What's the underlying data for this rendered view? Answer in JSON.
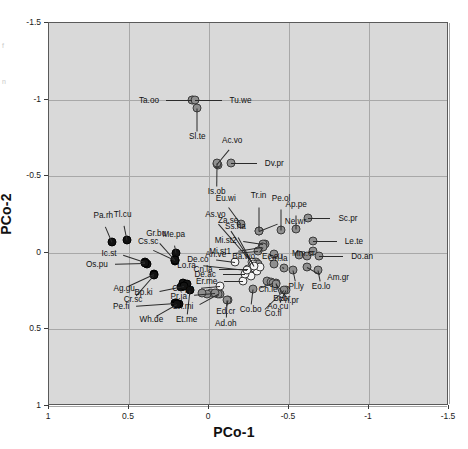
{
  "chart_data": {
    "type": "scatter",
    "title": "",
    "xlabel": "PCo-1",
    "ylabel": "PCo-2",
    "xlim": [
      1,
      -1.5
    ],
    "ylim": [
      -1.5,
      1
    ],
    "xticks": [
      "1",
      "0.5",
      "0",
      "-0.5",
      "-1",
      "-1.5"
    ],
    "xtickvalues": [
      1,
      0.5,
      0,
      -0.5,
      -1,
      -1.5
    ],
    "yticks": [
      "-1.5",
      "-1",
      "-0.5",
      "0",
      "0.5",
      "1"
    ],
    "ytickvalues": [
      -1.5,
      -1,
      -0.5,
      0,
      0.5,
      1
    ],
    "grid": true,
    "legend": "none",
    "plot_background": "#d9d9d9",
    "marker_groups": [
      {
        "name": "black-filled",
        "color": "#121212"
      },
      {
        "name": "gray-filled",
        "color": "#8f8f8f"
      },
      {
        "name": "white-open",
        "color": "#f4f4f4"
      }
    ],
    "points": [
      {
        "label": "Ta.oo",
        "x": 0.105,
        "y": -1.0,
        "group": "gray",
        "lx": 0.3,
        "ly": -1.0,
        "anchor": "r"
      },
      {
        "label": "Tu.we",
        "x": 0.09,
        "y": -1.0,
        "group": "gray",
        "lx": -0.11,
        "ly": -1.0,
        "anchor": "l"
      },
      {
        "label": "Sl.te",
        "x": 0.073,
        "y": -0.945,
        "group": "gray",
        "lx": 0.073,
        "ly": -0.76,
        "anchor": "c"
      },
      {
        "label": "Ac.vo",
        "x": -0.05,
        "y": -0.58,
        "group": "gray",
        "lx": -0.145,
        "ly": -0.7,
        "anchor": "c"
      },
      {
        "label": "Is.ob",
        "x": -0.05,
        "y": -0.585,
        "group": "gray",
        "lx": -0.048,
        "ly": -0.405,
        "anchor": "c"
      },
      {
        "label": "Dv.pr",
        "x": -0.14,
        "y": -0.585,
        "group": "gray",
        "lx": -0.33,
        "ly": -0.585,
        "anchor": "l"
      },
      {
        "label": "Eu.wi",
        "x": -0.2,
        "y": -0.185,
        "group": "gray",
        "lx": -0.105,
        "ly": -0.32,
        "anchor": "c"
      },
      {
        "label": "Tr.in",
        "x": -0.31,
        "y": -0.145,
        "group": "gray",
        "lx": -0.31,
        "ly": -0.335,
        "anchor": "c"
      },
      {
        "label": "Ne.wr",
        "x": -0.31,
        "y": -0.145,
        "group": "gray",
        "lx": -0.455,
        "ly": -0.205,
        "anchor": "l"
      },
      {
        "label": "Pe.ol",
        "x": -0.45,
        "y": -0.15,
        "group": "gray",
        "lx": -0.45,
        "ly": -0.32,
        "anchor": "c"
      },
      {
        "label": "Ap.pe",
        "x": -0.545,
        "y": -0.155,
        "group": "gray",
        "lx": -0.545,
        "ly": -0.28,
        "anchor": "c"
      },
      {
        "label": "Sc.pr",
        "x": -0.62,
        "y": -0.23,
        "group": "gray",
        "lx": -0.79,
        "ly": -0.23,
        "anchor": "l"
      },
      {
        "label": "Le.te",
        "x": -0.65,
        "y": -0.08,
        "group": "gray",
        "lx": -0.83,
        "ly": -0.08,
        "anchor": "l"
      },
      {
        "label": "Mi.st2",
        "x": -0.34,
        "y": -0.06,
        "group": "gray",
        "lx": -0.185,
        "ly": -0.085,
        "anchor": "r"
      },
      {
        "label": "Mi.st1",
        "x": -0.33,
        "y": -0.04,
        "group": "gray",
        "lx": -0.15,
        "ly": -0.01,
        "anchor": "r"
      },
      {
        "label": "Mm.cr",
        "x": -0.65,
        "y": -0.01,
        "group": "gray",
        "lx": -0.59,
        "ly": 0.0,
        "anchor": "c"
      },
      {
        "label": "Ec.cu",
        "x": -0.405,
        "y": 0.01,
        "group": "gray",
        "lx": -0.395,
        "ly": 0.018,
        "anchor": "c"
      },
      {
        "label": "Do.an",
        "x": -0.69,
        "y": 0.022,
        "group": "gray",
        "lx": -0.87,
        "ly": 0.022,
        "anchor": "l"
      },
      {
        "label": "Ba.wo",
        "x": -0.34,
        "y": -0.04,
        "group": "gray",
        "lx": -0.3,
        "ly": 0.022,
        "anchor": "r"
      },
      {
        "label": "An.ve",
        "x": -0.305,
        "y": -0.01,
        "group": "gray",
        "lx": -0.12,
        "ly": 0.005,
        "anchor": "r"
      },
      {
        "label": "On.la",
        "x": -0.47,
        "y": 0.1,
        "group": "gray",
        "lx": -0.43,
        "ly": 0.075,
        "anchor": "c"
      },
      {
        "label": "Am.gr",
        "x": -0.61,
        "y": 0.095,
        "group": "gray",
        "lx": -0.72,
        "ly": 0.16,
        "anchor": "l"
      },
      {
        "label": "Eo.lo",
        "x": -0.68,
        "y": 0.11,
        "group": "gray",
        "lx": -0.7,
        "ly": 0.215,
        "anchor": "c"
      },
      {
        "label": "Pl.ly",
        "x": -0.525,
        "y": 0.115,
        "group": "gray",
        "lx": -0.545,
        "ly": 0.215,
        "anchor": "c"
      },
      {
        "label": "Br.br",
        "x": -0.42,
        "y": 0.195,
        "group": "gray",
        "lx": -0.455,
        "ly": 0.295,
        "anchor": "c"
      },
      {
        "label": "Ch.le",
        "x": -0.4,
        "y": 0.195,
        "group": "gray",
        "lx": -0.29,
        "ly": 0.235,
        "anchor": "l"
      },
      {
        "label": "Ph.pr",
        "x": -0.42,
        "y": 0.205,
        "group": "gray",
        "lx": -0.5,
        "ly": 0.305,
        "anchor": "c"
      },
      {
        "label": "Ao.cu",
        "x": -0.48,
        "y": 0.24,
        "group": "gray",
        "lx": -0.43,
        "ly": 0.345,
        "anchor": "c"
      },
      {
        "label": "Co.fl",
        "x": -0.47,
        "y": 0.245,
        "group": "gray",
        "lx": -0.33,
        "ly": 0.39,
        "anchor": "l"
      },
      {
        "label": "Co.bo",
        "x": -0.275,
        "y": 0.235,
        "group": "gray",
        "lx": -0.26,
        "ly": 0.365,
        "anchor": "c"
      },
      {
        "label": "Ed.cr",
        "x": -0.12,
        "y": 0.31,
        "group": "gray",
        "lx": -0.105,
        "ly": 0.38,
        "anchor": "c"
      },
      {
        "label": "Ad.oh",
        "x": -0.11,
        "y": 0.31,
        "group": "gray",
        "lx": -0.105,
        "ly": 0.455,
        "anchor": "c"
      },
      {
        "label": "Ch.mi",
        "x": -0.055,
        "y": 0.27,
        "group": "gray",
        "lx": 0.085,
        "ly": 0.35,
        "anchor": "r"
      },
      {
        "label": "Pr.ja",
        "x": -0.04,
        "y": 0.265,
        "group": "gray",
        "lx": 0.125,
        "ly": 0.28,
        "anchor": "r"
      },
      {
        "label": "Ca.pa",
        "x": -0.07,
        "y": 0.215,
        "group": "white",
        "lx": 0.08,
        "ly": 0.23,
        "anchor": "r"
      },
      {
        "label": "Er.me",
        "x": -0.215,
        "y": 0.185,
        "group": "white",
        "lx": -0.065,
        "ly": 0.185,
        "anchor": "r"
      },
      {
        "label": "De.ac",
        "x": -0.225,
        "y": 0.14,
        "group": "white",
        "lx": -0.055,
        "ly": 0.14,
        "anchor": "r"
      },
      {
        "label": "Cn.la",
        "x": -0.245,
        "y": 0.105,
        "group": "white",
        "lx": -0.035,
        "ly": 0.105,
        "anchor": "r"
      },
      {
        "label": "De.co",
        "x": -0.16,
        "y": 0.06,
        "group": "white",
        "lx": -0.01,
        "ly": 0.04,
        "anchor": "r"
      },
      {
        "label": "Lo.ra",
        "x": -0.235,
        "y": 0.115,
        "group": "white",
        "lx": 0.07,
        "ly": 0.08,
        "anchor": "r"
      },
      {
        "label": "As.vo",
        "x": -0.27,
        "y": 0.06,
        "group": "white",
        "lx": -0.04,
        "ly": -0.215,
        "anchor": "c"
      },
      {
        "label": "Za.se",
        "x": -0.275,
        "y": 0.07,
        "group": "white",
        "lx": -0.12,
        "ly": -0.175,
        "anchor": "c"
      },
      {
        "label": "Ss.ha",
        "x": -0.28,
        "y": 0.085,
        "group": "white",
        "lx": -0.165,
        "ly": -0.135,
        "anchor": "c"
      },
      {
        "label": "Me.pa",
        "x": 0.205,
        "y": 0.0,
        "group": "black",
        "lx": 0.22,
        "ly": -0.085,
        "anchor": "c"
      },
      {
        "label": "Gr.bu",
        "x": 0.215,
        "y": 0.045,
        "group": "black",
        "lx": 0.33,
        "ly": -0.09,
        "anchor": "c"
      },
      {
        "label": "Cs.sc",
        "x": 0.215,
        "y": 0.045,
        "group": "black",
        "lx": 0.38,
        "ly": -0.035,
        "anchor": "c"
      },
      {
        "label": "Ic.st",
        "x": 0.4,
        "y": 0.06,
        "group": "black",
        "lx": 0.565,
        "ly": 0.003,
        "anchor": "r"
      },
      {
        "label": "Os.pu",
        "x": 0.4,
        "y": 0.065,
        "group": "black",
        "lx": 0.62,
        "ly": 0.07,
        "anchor": "r"
      },
      {
        "label": "Ag.gu",
        "x": 0.345,
        "y": 0.14,
        "group": "black",
        "lx": 0.53,
        "ly": 0.23,
        "anchor": "c"
      },
      {
        "label": "Cr.sc",
        "x": 0.345,
        "y": 0.145,
        "group": "black",
        "lx": 0.475,
        "ly": 0.3,
        "anchor": "c"
      },
      {
        "label": "Bp.ki",
        "x": 0.155,
        "y": 0.215,
        "group": "black",
        "lx": 0.34,
        "ly": 0.255,
        "anchor": "r"
      },
      {
        "label": "Pe.fi",
        "x": 0.205,
        "y": 0.33,
        "group": "black",
        "lx": 0.485,
        "ly": 0.35,
        "anchor": "r"
      },
      {
        "label": "Wh.de",
        "x": 0.2,
        "y": 0.335,
        "group": "black",
        "lx": 0.36,
        "ly": 0.43,
        "anchor": "c"
      },
      {
        "label": "Et.me",
        "x": 0.12,
        "y": 0.245,
        "group": "black",
        "lx": 0.14,
        "ly": 0.43,
        "anchor": "c"
      },
      {
        "label": "Pa.rh",
        "x": 0.605,
        "y": -0.07,
        "group": "black",
        "lx": 0.66,
        "ly": -0.205,
        "anchor": "c"
      },
      {
        "label": "Tl.cu",
        "x": 0.515,
        "y": -0.085,
        "group": "black",
        "lx": 0.54,
        "ly": -0.215,
        "anchor": "c"
      }
    ],
    "extra_markers": [
      {
        "x": 0.1,
        "y": -1.0,
        "group": "gray"
      },
      {
        "x": -0.055,
        "y": -0.575,
        "group": "gray"
      },
      {
        "x": -0.335,
        "y": -0.05,
        "group": "gray"
      },
      {
        "x": -0.35,
        "y": -0.055,
        "group": "gray"
      },
      {
        "x": -0.295,
        "y": 0.06,
        "group": "gray"
      },
      {
        "x": -0.275,
        "y": 0.075,
        "group": "gray"
      },
      {
        "x": -0.305,
        "y": 0.07,
        "group": "gray"
      },
      {
        "x": -0.405,
        "y": 0.075,
        "group": "gray"
      },
      {
        "x": -0.56,
        "y": 0.015,
        "group": "gray"
      },
      {
        "x": -0.615,
        "y": 0.022,
        "group": "gray"
      },
      {
        "x": -0.365,
        "y": 0.185,
        "group": "gray"
      },
      {
        "x": -0.39,
        "y": 0.19,
        "group": "gray"
      },
      {
        "x": -0.07,
        "y": 0.27,
        "group": "gray"
      },
      {
        "x": -0.015,
        "y": 0.265,
        "group": "gray"
      },
      {
        "x": 0.015,
        "y": 0.268,
        "group": "gray"
      },
      {
        "x": 0.045,
        "y": 0.265,
        "group": "gray"
      },
      {
        "x": -0.265,
        "y": 0.15,
        "group": "white"
      },
      {
        "x": -0.3,
        "y": 0.12,
        "group": "white"
      },
      {
        "x": -0.32,
        "y": 0.095,
        "group": "white"
      },
      {
        "x": -0.26,
        "y": 0.1,
        "group": "white"
      },
      {
        "x": 0.16,
        "y": 0.2,
        "group": "black"
      },
      {
        "x": 0.14,
        "y": 0.205,
        "group": "black"
      },
      {
        "x": 0.175,
        "y": 0.225,
        "group": "black"
      },
      {
        "x": 0.215,
        "y": 0.33,
        "group": "black"
      },
      {
        "x": 0.19,
        "y": 0.335,
        "group": "black"
      },
      {
        "x": 0.39,
        "y": 0.075,
        "group": "black"
      },
      {
        "x": 0.215,
        "y": 0.055,
        "group": "black"
      }
    ]
  },
  "caption_fragments": [
    "f",
    "n"
  ]
}
